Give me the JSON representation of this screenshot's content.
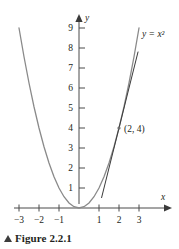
{
  "figure": {
    "caption_marker": "triangle-up",
    "caption_text": "Figure 2.2.1"
  },
  "chart_data": {
    "type": "line",
    "title": "",
    "subtitle": "",
    "xlabel": "x",
    "ylabel": "y",
    "xlim": [
      -3.6,
      3.6
    ],
    "ylim": [
      -0.6,
      9.6
    ],
    "grid": false,
    "legend": "none",
    "x_ticks": [
      -3,
      -2,
      -1,
      1,
      2,
      3
    ],
    "x_tick_labels": [
      "−3",
      "−2",
      "−1",
      "1",
      "2",
      "3"
    ],
    "y_ticks": [
      1,
      2,
      3,
      4,
      5,
      6,
      7,
      8,
      9
    ],
    "y_tick_labels": [
      "1",
      "2",
      "3",
      "4",
      "5",
      "6",
      "7",
      "8",
      "9"
    ],
    "series": [
      {
        "name": "y = x^2",
        "label": "y = x²",
        "type": "curve",
        "color": "#8a8a8a",
        "x": [
          -3,
          -2.75,
          -2.5,
          -2.25,
          -2,
          -1.75,
          -1.5,
          -1.25,
          -1,
          -0.75,
          -0.5,
          -0.25,
          0,
          0.25,
          0.5,
          0.75,
          1,
          1.25,
          1.5,
          1.75,
          2,
          2.25,
          2.5,
          2.75,
          3
        ],
        "y": [
          9,
          7.5625,
          6.25,
          5.0625,
          4,
          3.0625,
          2.25,
          1.5625,
          1,
          0.5625,
          0.25,
          0.0625,
          0,
          0.0625,
          0.25,
          0.5625,
          1,
          1.5625,
          2.25,
          3.0625,
          4,
          5.0625,
          6.25,
          7.5625,
          9
        ]
      },
      {
        "name": "tangent at (2,4)",
        "label": "",
        "type": "line",
        "color": "#3a3a3a",
        "equation": "y = 4x - 4",
        "x": [
          1.13,
          2.95
        ],
        "y": [
          0.52,
          7.8
        ]
      }
    ],
    "points": [
      {
        "name": "tangency-point",
        "x": 2,
        "y": 4,
        "label": "(2, 4)",
        "color": "#6e6e6e"
      }
    ],
    "annotations": [
      {
        "name": "curve-equation-label",
        "text": "y = x²",
        "x": 3.15,
        "y": 8.55
      },
      {
        "name": "x-axis-name",
        "text": "x",
        "x": 3.45,
        "y": 0.62
      },
      {
        "name": "y-axis-name",
        "text": "y",
        "x": 0.32,
        "y": 9.62
      }
    ]
  }
}
